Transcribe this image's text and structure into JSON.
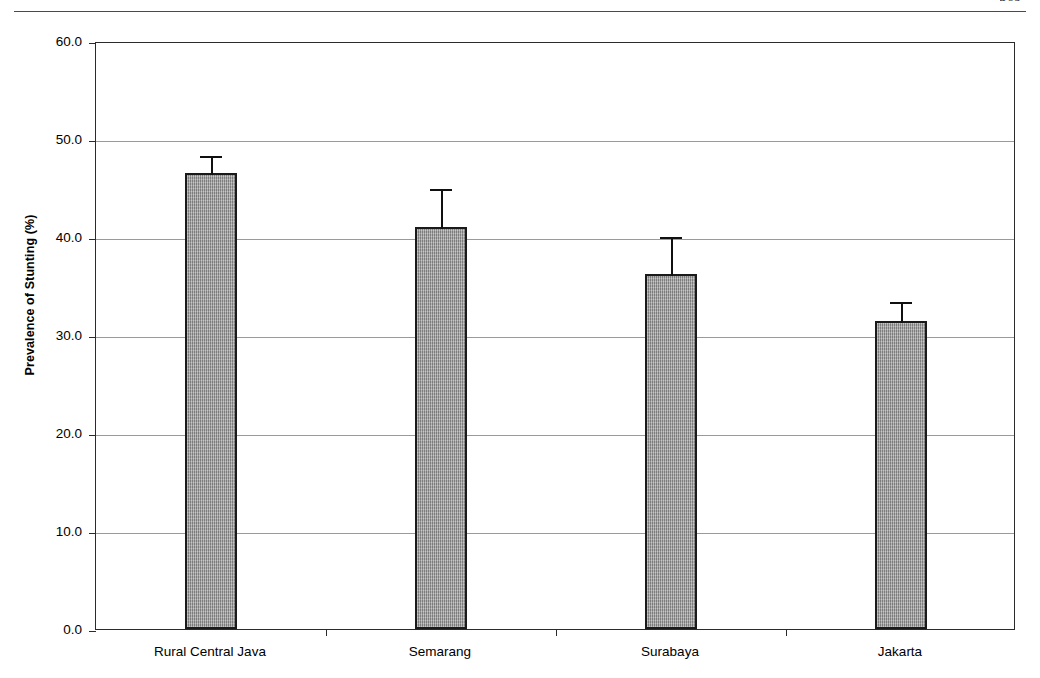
{
  "page": {
    "header_left": "",
    "header_right": "569"
  },
  "chart_data": {
    "type": "bar",
    "title": "",
    "xlabel": "",
    "ylabel": "Prevalence of Stunting (%)",
    "categories": [
      "Rural Central Java",
      "Semarang",
      "Surabaya",
      "Jakarta"
    ],
    "values": [
      46.5,
      41.0,
      36.2,
      31.4
    ],
    "errors": [
      2.0,
      4.1,
      4.0,
      2.2
    ],
    "error_upper": [
      48.5,
      45.1,
      40.2,
      33.6
    ],
    "ylim": [
      0.0,
      60.0
    ],
    "ytick_labels": [
      "0.0",
      "10.0",
      "20.0",
      "30.0",
      "40.0",
      "50.0",
      "60.0"
    ],
    "ytick_values": [
      0,
      10,
      20,
      30,
      40,
      50,
      60
    ],
    "grid": "horizontal",
    "legend": "none",
    "bar_fill_color": "#a0a0a0",
    "bar_edge_color": "#1a1a1a",
    "error_bar_color": "#101010",
    "error_bar_direction": "upper-only"
  }
}
